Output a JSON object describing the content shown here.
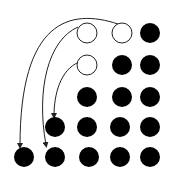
{
  "diagram": {
    "dot_radius": 10,
    "open_radius": 10,
    "colors": {
      "filled": "#000000",
      "open_fill": "#ffffff",
      "stroke": "#222222"
    },
    "dots": [
      {
        "row": 1,
        "x": 87,
        "y": 33,
        "type": "open"
      },
      {
        "row": 1,
        "x": 122,
        "y": 33,
        "type": "open"
      },
      {
        "row": 1,
        "x": 150,
        "y": 33,
        "type": "filled"
      },
      {
        "row": 2,
        "x": 87,
        "y": 65,
        "type": "open"
      },
      {
        "row": 2,
        "x": 122,
        "y": 65,
        "type": "filled"
      },
      {
        "row": 2,
        "x": 150,
        "y": 65,
        "type": "filled"
      },
      {
        "row": 3,
        "x": 87,
        "y": 97,
        "type": "filled"
      },
      {
        "row": 3,
        "x": 122,
        "y": 97,
        "type": "filled"
      },
      {
        "row": 3,
        "x": 150,
        "y": 97,
        "type": "filled"
      },
      {
        "row": 4,
        "x": 55,
        "y": 127,
        "type": "filled"
      },
      {
        "row": 4,
        "x": 87,
        "y": 127,
        "type": "filled"
      },
      {
        "row": 4,
        "x": 120,
        "y": 127,
        "type": "filled"
      },
      {
        "row": 4,
        "x": 150,
        "y": 127,
        "type": "filled"
      },
      {
        "row": 5,
        "x": 24,
        "y": 157,
        "type": "filled"
      },
      {
        "row": 5,
        "x": 55,
        "y": 157,
        "type": "filled"
      },
      {
        "row": 5,
        "x": 89,
        "y": 157,
        "type": "filled"
      },
      {
        "row": 5,
        "x": 120,
        "y": 157,
        "type": "filled"
      },
      {
        "row": 5,
        "x": 150,
        "y": 157,
        "type": "filled"
      }
    ],
    "arcs": [
      {
        "from": [
          122,
          23
        ],
        "to": [
          21,
          147
        ],
        "d": "M 118 24 C 70 8, 20 20, 20 146"
      },
      {
        "from": [
          80,
          28
        ],
        "to": [
          50,
          148
        ],
        "d": "M 78 27 C 48 40, 36 90, 46 145"
      },
      {
        "from": [
          80,
          60
        ],
        "to": [
          55,
          117
        ],
        "d": "M 79 62 C 60 70, 54 95, 54 116"
      }
    ]
  }
}
